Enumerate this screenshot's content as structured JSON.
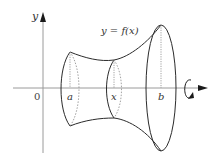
{
  "diagram": {
    "axes": {
      "y_label": "y",
      "origin_label": "0",
      "color": "#9a9a9a"
    },
    "curve_label": "y = f(x)",
    "cross_sections": [
      {
        "label": "a"
      },
      {
        "label": "x"
      },
      {
        "label": "b"
      }
    ],
    "rotation_indicator": "rotate-about-x-axis",
    "colors": {
      "outline": "#2b2b2b",
      "dotted": "#8a8a8a",
      "axis": "#9a9a9a",
      "background": "#ffffff"
    }
  }
}
